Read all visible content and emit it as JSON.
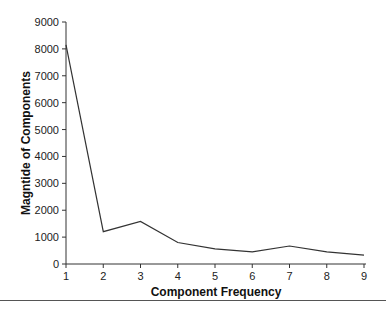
{
  "chart_data": {
    "type": "line",
    "title": "",
    "xlabel": "Component Frequency",
    "ylabel": "Magntide of Components",
    "x": [
      1,
      2,
      3,
      4,
      5,
      6,
      7,
      8,
      9
    ],
    "series": [
      {
        "name": "Magnitude",
        "values": [
          8150,
          1200,
          1580,
          800,
          560,
          450,
          670,
          450,
          330
        ]
      }
    ],
    "xticks": [
      "1",
      "2",
      "3",
      "4",
      "5",
      "6",
      "7",
      "8",
      "9"
    ],
    "yticks": [
      "0",
      "1000",
      "2000",
      "3000",
      "4000",
      "5000",
      "6000",
      "7000",
      "8000",
      "9000"
    ],
    "xlim": [
      1,
      9
    ],
    "ylim": [
      0,
      9000
    ],
    "grid": false,
    "legend": null,
    "line_color": "#333333"
  }
}
